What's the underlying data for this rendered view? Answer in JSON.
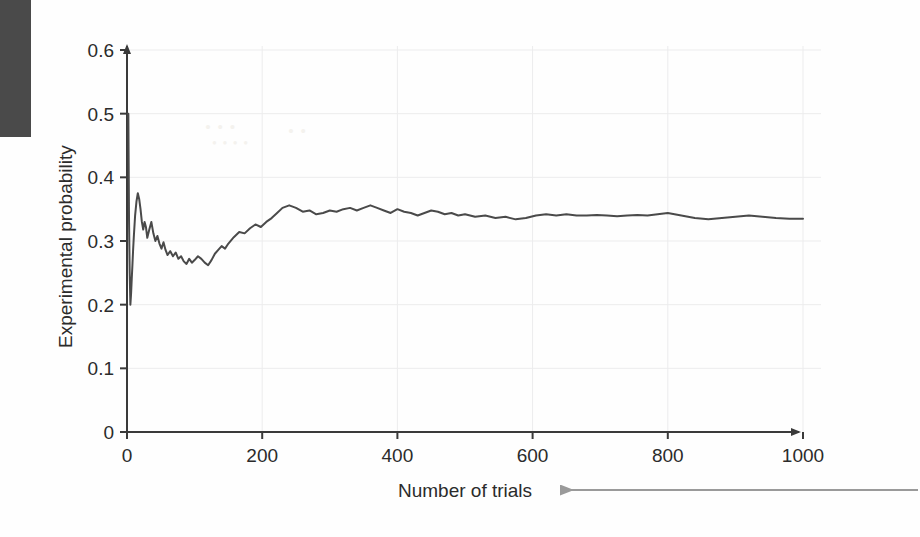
{
  "figure": {
    "scan_edge_color": "#4a4a4a",
    "background_color": "#fefefe",
    "artifacts": [
      {
        "text": "• • •"
      },
      {
        "text": "• •"
      },
      {
        "text": "• • • •"
      }
    ]
  },
  "annotation": {
    "leader_arrow_label": "leader-arrow-to-x-axis-title",
    "leader_arrow_color": "#9a9a9a",
    "direction": "left"
  },
  "chart_data": {
    "type": "line",
    "title": "",
    "subtitle": "",
    "xlabel": "Number of trials",
    "ylabel": "Experimental probability",
    "xlim": [
      0,
      1000
    ],
    "ylim": [
      0,
      0.6
    ],
    "xticks": [
      0,
      200,
      400,
      600,
      800,
      1000
    ],
    "yticks": [
      0,
      0.1,
      0.2,
      0.3,
      0.4,
      0.5,
      0.6
    ],
    "xtick_labels": [
      "0",
      "200",
      "400",
      "600",
      "800",
      "1000"
    ],
    "ytick_labels": [
      "0",
      "0.1",
      "0.2",
      "0.3",
      "0.4",
      "0.5",
      "0.6"
    ],
    "grid": true,
    "grid_color": "#ececed",
    "legend": null,
    "legend_position": "none",
    "axis_arrowheads": true,
    "line_color": "#4a4a4a",
    "line_width": 2,
    "converges_to": 0.335,
    "series": [
      {
        "name": "Experimental probability",
        "x": [
          1,
          2,
          3,
          4,
          5,
          6,
          7,
          8,
          9,
          10,
          12,
          14,
          16,
          18,
          20,
          22,
          24,
          26,
          28,
          30,
          33,
          36,
          39,
          42,
          45,
          48,
          51,
          54,
          57,
          60,
          64,
          68,
          72,
          76,
          80,
          84,
          88,
          92,
          96,
          100,
          105,
          110,
          115,
          120,
          125,
          130,
          135,
          140,
          145,
          150,
          158,
          166,
          174,
          182,
          190,
          198,
          206,
          214,
          222,
          230,
          240,
          250,
          260,
          270,
          280,
          290,
          300,
          310,
          320,
          330,
          340,
          350,
          360,
          370,
          380,
          390,
          400,
          410,
          420,
          430,
          440,
          450,
          460,
          470,
          480,
          490,
          500,
          515,
          530,
          545,
          560,
          575,
          590,
          605,
          620,
          635,
          650,
          665,
          680,
          695,
          710,
          725,
          740,
          755,
          770,
          785,
          800,
          820,
          840,
          860,
          880,
          900,
          920,
          940,
          960,
          980,
          1000
        ],
        "y": [
          0.5,
          0.5,
          0.333,
          0.25,
          0.2,
          0.217,
          0.24,
          0.262,
          0.285,
          0.305,
          0.34,
          0.362,
          0.375,
          0.366,
          0.35,
          0.33,
          0.318,
          0.33,
          0.322,
          0.305,
          0.318,
          0.33,
          0.312,
          0.3,
          0.308,
          0.296,
          0.288,
          0.298,
          0.286,
          0.278,
          0.284,
          0.276,
          0.282,
          0.272,
          0.276,
          0.268,
          0.264,
          0.272,
          0.266,
          0.27,
          0.276,
          0.272,
          0.266,
          0.262,
          0.27,
          0.28,
          0.286,
          0.292,
          0.288,
          0.296,
          0.306,
          0.314,
          0.312,
          0.32,
          0.326,
          0.322,
          0.33,
          0.336,
          0.344,
          0.352,
          0.356,
          0.352,
          0.346,
          0.348,
          0.342,
          0.344,
          0.348,
          0.346,
          0.35,
          0.352,
          0.348,
          0.352,
          0.356,
          0.352,
          0.348,
          0.344,
          0.35,
          0.346,
          0.344,
          0.34,
          0.344,
          0.348,
          0.346,
          0.342,
          0.344,
          0.34,
          0.342,
          0.338,
          0.34,
          0.336,
          0.338,
          0.334,
          0.336,
          0.34,
          0.342,
          0.34,
          0.342,
          0.34,
          0.34,
          0.341,
          0.34,
          0.339,
          0.34,
          0.341,
          0.34,
          0.342,
          0.344,
          0.34,
          0.336,
          0.334,
          0.336,
          0.338,
          0.34,
          0.338,
          0.336,
          0.335,
          0.335
        ]
      }
    ]
  }
}
